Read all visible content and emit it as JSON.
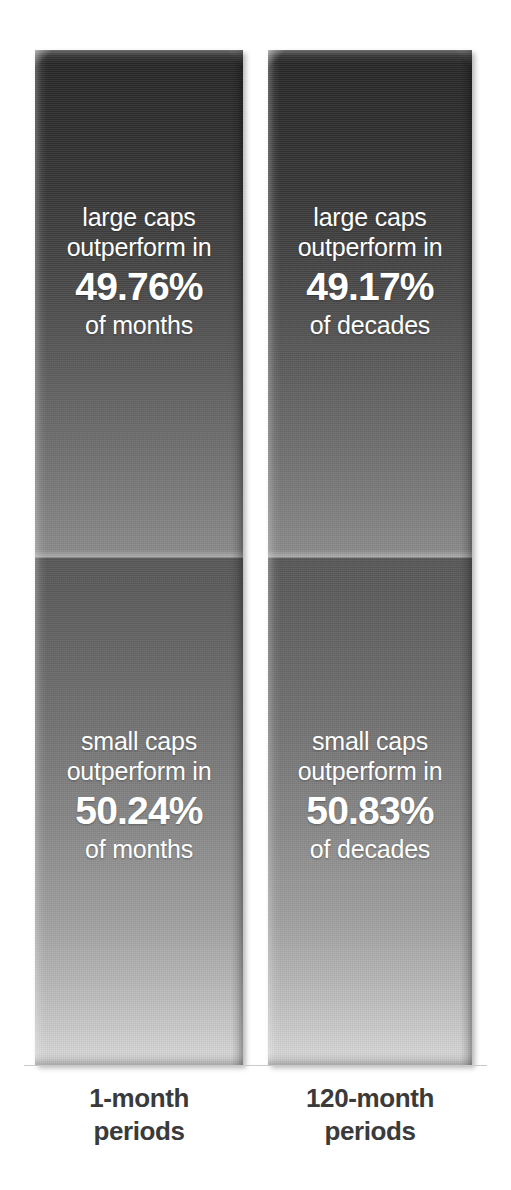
{
  "chart_data": {
    "type": "bar",
    "title": "",
    "subtitle": "",
    "xlabel": "",
    "ylabel": "",
    "ylim": [
      0,
      100
    ],
    "grid": false,
    "legend": "none",
    "orientation": "vertical",
    "stacked": true,
    "units": "percent",
    "categories": [
      "1-month periods",
      "120-month periods"
    ],
    "series": [
      {
        "name": "large caps outperform",
        "values": [
          49.76,
          49.17
        ]
      },
      {
        "name": "small caps outperform",
        "values": [
          50.24,
          50.83
        ]
      }
    ],
    "annotations": [
      "large caps outperform in 49.76% of months",
      "small caps outperform in 50.24% of months",
      "large caps outperform in 49.17% of decades",
      "small caps outperform in 50.83% of decades"
    ]
  },
  "colors": {
    "background": "#ffffff",
    "segment_top_dark": "#262626",
    "segment_top_light": "#8b8b8b",
    "segment_bottom_dark": "#565656",
    "segment_bottom_light": "#d9d9d9",
    "label_text": "#3a3a3a",
    "in_bar_text": "#ffffff",
    "baseline": "#c9c9c9"
  },
  "columns": [
    {
      "axis_label_line1": "1-month",
      "axis_label_line2": "periods",
      "segments": [
        {
          "line1": "large caps",
          "line2": "outperform in",
          "value": "49.76%",
          "line4": "of months"
        },
        {
          "line1": "small caps",
          "line2": "outperform in",
          "value": "50.24%",
          "line4": "of months"
        }
      ]
    },
    {
      "axis_label_line1": "120-month",
      "axis_label_line2": "periods",
      "segments": [
        {
          "line1": "large caps",
          "line2": "outperform in",
          "value": "49.17%",
          "line4": "of decades"
        },
        {
          "line1": "small caps",
          "line2": "outperform in",
          "value": "50.83%",
          "line4": "of decades"
        }
      ]
    }
  ]
}
